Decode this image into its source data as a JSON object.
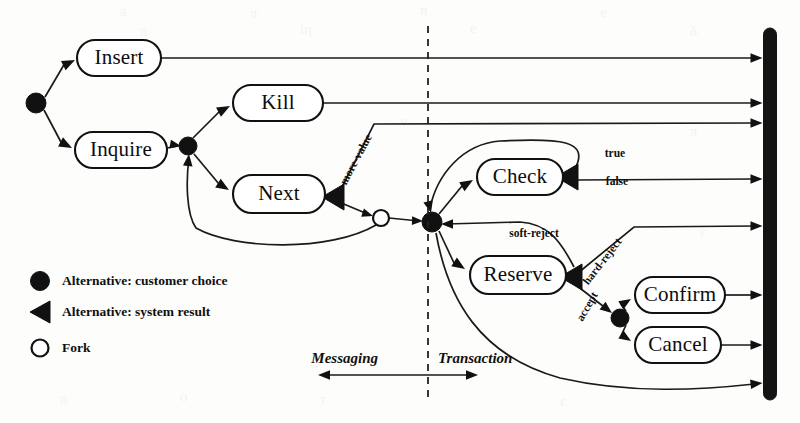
{
  "diagram": {
    "type": "activity-state-diagram",
    "colors": {
      "ink": "#111111",
      "paper": "#fdfdfb",
      "join_bar": "#141414"
    },
    "nodes": [
      {
        "id": "insert",
        "label": "Insert",
        "x": 119,
        "y": 58,
        "w": 84,
        "h": 36
      },
      {
        "id": "inquire",
        "label": "Inquire",
        "x": 121,
        "y": 150,
        "w": 92,
        "h": 36
      },
      {
        "id": "kill",
        "label": "Kill",
        "x": 278,
        "y": 103,
        "w": 90,
        "h": 36
      },
      {
        "id": "next",
        "label": "Next",
        "x": 279,
        "y": 194,
        "w": 92,
        "h": 38
      },
      {
        "id": "check",
        "label": "Check",
        "x": 520,
        "y": 177,
        "w": 86,
        "h": 36
      },
      {
        "id": "reserve",
        "label": "Reserve",
        "x": 518,
        "y": 275,
        "w": 96,
        "h": 38
      },
      {
        "id": "confirm",
        "label": "Confirm",
        "x": 680,
        "y": 295,
        "w": 90,
        "h": 36
      },
      {
        "id": "cancel",
        "label": "Cancel",
        "x": 678,
        "y": 345,
        "w": 86,
        "h": 36
      }
    ],
    "choice_points": [
      {
        "id": "start",
        "x": 36,
        "y": 103,
        "r": 10
      },
      {
        "id": "inquire-fork",
        "x": 188,
        "y": 146,
        "r": 9
      },
      {
        "id": "txn-hub",
        "x": 432,
        "y": 222,
        "r": 10
      },
      {
        "id": "accept-choice",
        "x": 620,
        "y": 318,
        "r": 9
      }
    ],
    "fork_points": [
      {
        "id": "fork-next",
        "x": 381,
        "y": 218,
        "r": 8
      }
    ],
    "system_results": [
      {
        "id": "next-result",
        "x": 332,
        "y": 197
      },
      {
        "id": "check-result",
        "x": 566,
        "y": 177
      },
      {
        "id": "reserve-result",
        "x": 570,
        "y": 277
      }
    ],
    "join_bar": {
      "x": 770,
      "y_top": 28,
      "y_bottom": 400,
      "width": 13
    },
    "divider": {
      "x": 428,
      "y_top": 26,
      "y_bottom": 397
    },
    "edge_labels": [
      {
        "id": "no-more-value",
        "text": "no-more-value",
        "x": 353,
        "y": 167,
        "rotate": -62
      },
      {
        "id": "true",
        "text": "true",
        "x": 615,
        "y": 154,
        "rotate": 0
      },
      {
        "id": "false",
        "text": "false",
        "x": 617,
        "y": 182,
        "rotate": 0
      },
      {
        "id": "soft-reject",
        "text": "soft-reject",
        "x": 534,
        "y": 234,
        "rotate": 0
      },
      {
        "id": "hard-reject",
        "text": "hard-reject",
        "x": 603,
        "y": 262,
        "rotate": -52
      },
      {
        "id": "accept",
        "text": "accept",
        "x": 588,
        "y": 307,
        "rotate": -60
      }
    ],
    "legend": {
      "items": [
        {
          "id": "customer-choice",
          "marker": "filled-circle",
          "label": "Alternative: customer choice",
          "x": 40,
          "y": 281
        },
        {
          "id": "system-result",
          "marker": "filled-triangle",
          "label": "Alternative: system result",
          "x": 40,
          "y": 312
        },
        {
          "id": "fork",
          "marker": "hollow-circle",
          "label": "Fork",
          "x": 40,
          "y": 348
        }
      ],
      "label_x": 62
    },
    "phase_axis": {
      "left_label": "Messaging",
      "right_label": "Transaction",
      "left_label_x": 378,
      "right_label_x": 438,
      "label_y": 360,
      "arrow_y": 375,
      "arrow_x_start": 318,
      "arrow_x_end": 478
    },
    "scan_artifacts": [
      {
        "text": "a",
        "x": 120,
        "y": 10
      },
      {
        "text": "π",
        "x": 250,
        "y": 12
      },
      {
        "text": "n",
        "x": 420,
        "y": 9
      },
      {
        "text": "e",
        "x": 600,
        "y": 11
      },
      {
        "text": "π",
        "x": 140,
        "y": 30
      },
      {
        "text": "iη",
        "x": 300,
        "y": 28
      },
      {
        "text": "e",
        "x": 470,
        "y": 27
      },
      {
        "text": "δ",
        "x": 690,
        "y": 30
      },
      {
        "text": "π",
        "x": 690,
        "y": 130
      },
      {
        "text": "ε",
        "x": 700,
        "y": 230
      },
      {
        "text": "n",
        "x": 660,
        "y": 330
      },
      {
        "text": "ο",
        "x": 180,
        "y": 395
      },
      {
        "text": "τ",
        "x": 320,
        "y": 398
      },
      {
        "text": "ε",
        "x": 560,
        "y": 400
      },
      {
        "text": "π",
        "x": 60,
        "y": 398
      },
      {
        "text": "ν",
        "x": 400,
        "y": 120
      }
    ]
  }
}
